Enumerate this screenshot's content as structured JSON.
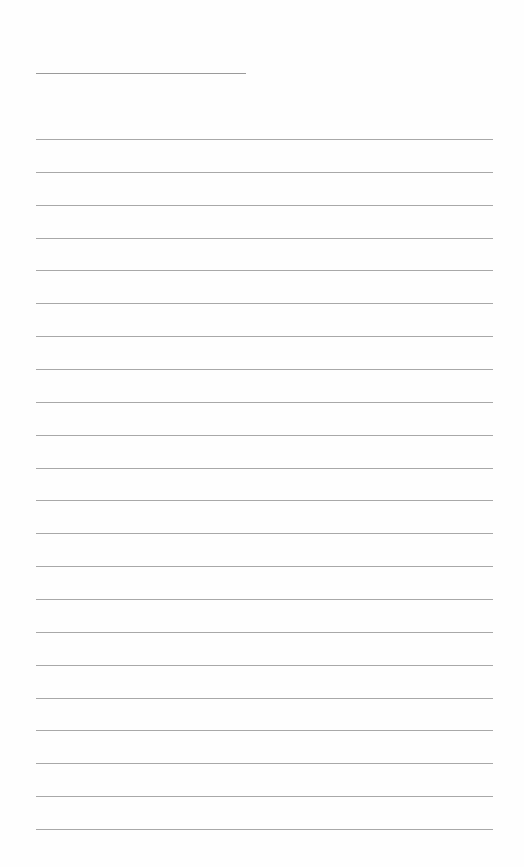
{
  "page": {
    "type": "lined-paper",
    "background_color": "#ffffff",
    "line_color": "#a8a8a8"
  },
  "header_line": {
    "top": 73,
    "left": 36,
    "width": 210
  },
  "ruled_lines": {
    "count": 22,
    "first_top": 139,
    "spacing": 32.86,
    "left": 36,
    "width": 457
  }
}
